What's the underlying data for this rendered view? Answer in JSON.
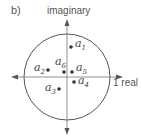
{
  "panel_label": "b)",
  "axes": {
    "vertical_label": "imaginary",
    "horizontal_label": "1 real"
  },
  "colors": {
    "stroke": "#555555",
    "dot": "#333333",
    "text": "#444444"
  },
  "circle": {
    "cx": 67,
    "cy": 77,
    "r": 43
  },
  "points": [
    {
      "name": "a",
      "sub": "1",
      "x": 71,
      "y": 47,
      "lx": 75,
      "ly": 47
    },
    {
      "name": "a",
      "sub": "2",
      "x": 48,
      "y": 70,
      "lx": 34,
      "ly": 71
    },
    {
      "name": "a",
      "sub": "3",
      "x": 59,
      "y": 89,
      "lx": 45,
      "ly": 91
    },
    {
      "name": "a",
      "sub": "4",
      "x": 74,
      "y": 82,
      "lx": 78,
      "ly": 84
    },
    {
      "name": "a",
      "sub": "5",
      "x": 72,
      "y": 72,
      "lx": 76,
      "ly": 71
    },
    {
      "name": "a",
      "sub": "6",
      "x": 64,
      "y": 72,
      "lx": 55,
      "ly": 65
    }
  ]
}
